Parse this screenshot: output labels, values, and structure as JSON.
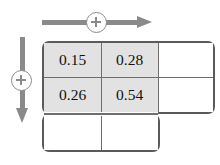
{
  "figure": {
    "type": "grid-matrix-diagram",
    "background_color": "#ffffff"
  },
  "annotations": {
    "horizontal": {
      "icon": "arrow-right-icon",
      "badge_icon": "plus-circle-icon",
      "badge_label": "+",
      "direction": "right",
      "color": "#8a8a8a"
    },
    "vertical": {
      "icon": "arrow-down-icon",
      "badge_icon": "plus-circle-icon",
      "badge_label": "+",
      "direction": "down",
      "color": "#8a8a8a"
    }
  },
  "grid": {
    "border_color": "#5a5a5a",
    "divider_color": "#6e6e6e",
    "shaded_fill": "#e2e2e2",
    "empty_fill": "#ffffff",
    "columns": 3,
    "rows": 3,
    "shape": "staircase",
    "cells": [
      [
        {
          "value": "0.15",
          "shaded": true
        },
        {
          "value": "0.28",
          "shaded": true
        },
        {
          "value": "",
          "shaded": false
        }
      ],
      [
        {
          "value": "0.26",
          "shaded": true
        },
        {
          "value": "0.54",
          "shaded": true
        },
        {
          "value": "",
          "shaded": false
        }
      ],
      [
        {
          "value": "",
          "shaded": false
        },
        {
          "value": "",
          "shaded": false
        }
      ]
    ]
  }
}
